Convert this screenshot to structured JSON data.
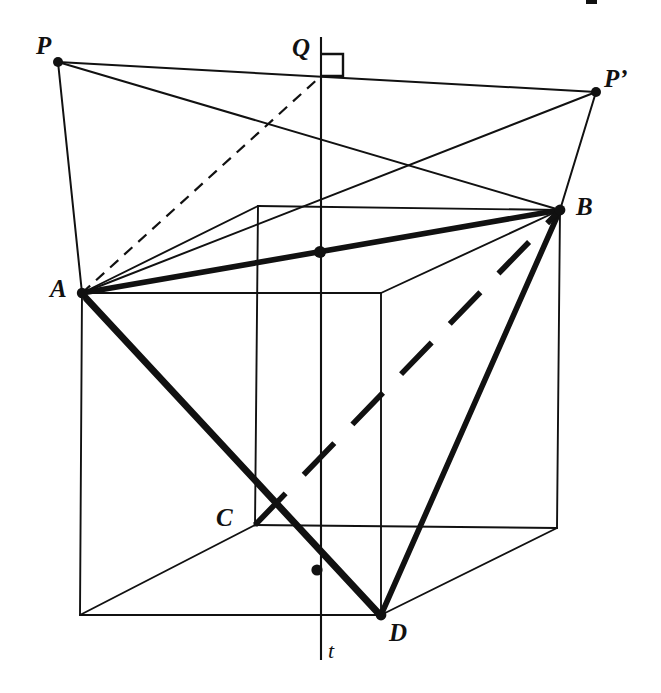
{
  "figure": {
    "background_color": "#ffffff",
    "stroke_color": "#111111",
    "width": 661,
    "height": 693
  },
  "labels": {
    "P": "P",
    "P_prime": "P’",
    "Q": "Q",
    "A": "A",
    "B": "B",
    "C": "C",
    "D": "D",
    "t": "t",
    "top_clipped": "▪"
  },
  "points": {
    "P": {
      "x": 58,
      "y": 62,
      "dot": true
    },
    "Q": {
      "x": 321,
      "y": 76,
      "dot": false
    },
    "P_prime": {
      "x": 596,
      "y": 92,
      "dot": true
    },
    "A": {
      "x": 82,
      "y": 293,
      "dot": true
    },
    "B": {
      "x": 560,
      "y": 210,
      "dot": true
    },
    "C": {
      "x": 255,
      "y": 525,
      "dot": false
    },
    "D": {
      "x": 381,
      "y": 615,
      "dot": true
    },
    "M_AB": {
      "x": 320,
      "y": 252,
      "dot": true
    },
    "M_CD": {
      "x": 317,
      "y": 570,
      "dot": true
    },
    "cube_front_top_left": {
      "x": 82,
      "y": 293,
      "dot": false
    },
    "cube_front_top_right": {
      "x": 381,
      "y": 293,
      "dot": false
    },
    "cube_front_bottom_left": {
      "x": 80,
      "y": 615,
      "dot": false
    },
    "cube_front_bottom_right": {
      "x": 381,
      "y": 615,
      "dot": false
    },
    "cube_back_top_left": {
      "x": 258,
      "y": 206,
      "dot": false
    },
    "cube_back_top_right": {
      "x": 560,
      "y": 210,
      "dot": false
    },
    "cube_back_bottom_left": {
      "x": 255,
      "y": 525,
      "dot": false
    },
    "cube_back_bottom_right": {
      "x": 557,
      "y": 528,
      "dot": false
    }
  },
  "segments": {
    "cube_edges": [
      {
        "name": "front-top",
        "from": "cube_front_top_left",
        "to": "cube_front_top_right"
      },
      {
        "name": "front-left",
        "from": "cube_front_top_left",
        "to": "cube_front_bottom_left"
      },
      {
        "name": "front-right",
        "from": "cube_front_top_right",
        "to": "cube_front_bottom_right"
      },
      {
        "name": "front-bottom",
        "from": "cube_front_bottom_left",
        "to": "cube_front_bottom_right"
      },
      {
        "name": "back-top",
        "from": "cube_back_top_left",
        "to": "cube_back_top_right"
      },
      {
        "name": "back-left",
        "from": "cube_back_top_left",
        "to": "cube_back_bottom_left"
      },
      {
        "name": "back-right",
        "from": "cube_back_top_right",
        "to": "cube_back_bottom_right"
      },
      {
        "name": "back-bottom",
        "from": "cube_back_bottom_left",
        "to": "cube_back_bottom_right"
      },
      {
        "name": "depth-top-left",
        "from": "cube_front_top_left",
        "to": "cube_back_top_left"
      },
      {
        "name": "depth-top-right",
        "from": "cube_front_top_right",
        "to": "cube_back_top_right"
      },
      {
        "name": "depth-bottom-left",
        "from": "cube_front_bottom_left",
        "to": "cube_back_bottom_left"
      },
      {
        "name": "depth-bottom-right",
        "from": "cube_front_bottom_right",
        "to": "cube_back_bottom_right"
      }
    ],
    "thick_solid": [
      {
        "name": "segment-AB",
        "from": "A",
        "to": "B"
      },
      {
        "name": "segment-AD",
        "from": "A",
        "to": "D"
      },
      {
        "name": "segment-AC-extended-D",
        "from": "A",
        "to": "D"
      },
      {
        "name": "segment-BD",
        "from": "B",
        "to": "D"
      }
    ],
    "thick_dashed": [
      {
        "name": "segment-CB-hidden",
        "from": "C",
        "to": "B"
      }
    ],
    "thin_dashed": [
      {
        "name": "segment-AQ",
        "from": "A",
        "to": "Q"
      }
    ],
    "thin_solid": [
      {
        "name": "segment-P-Pprime",
        "from": "P",
        "to": "P_prime"
      },
      {
        "name": "segment-PA",
        "from": "P",
        "to": "A"
      },
      {
        "name": "segment-PB",
        "from": "P",
        "to": "B"
      },
      {
        "name": "segment-Pprime-A",
        "from": "P_prime",
        "to": "A"
      },
      {
        "name": "segment-Pprime-B",
        "from": "P_prime",
        "to": "B"
      }
    ]
  },
  "axis_t": {
    "label": "t",
    "x": 321,
    "y_top": 37,
    "y_bottom": 660,
    "label_x": 330,
    "label_y": 646
  },
  "right_angle_mark": {
    "at": "Q",
    "x": 321,
    "y": 76,
    "size": 22,
    "direction": "up-right"
  },
  "midpoint_dots": [
    {
      "name": "midpoint-AB-on-t",
      "x": 320,
      "y": 252
    },
    {
      "name": "midpoint-CD-on-t",
      "x": 317,
      "y": 570
    }
  ],
  "label_positions": {
    "P": {
      "x": 36,
      "y": 33
    },
    "Q": {
      "x": 292,
      "y": 35
    },
    "P_prime": {
      "x": 604,
      "y": 66
    },
    "A": {
      "x": 50,
      "y": 276
    },
    "B": {
      "x": 576,
      "y": 194
    },
    "C": {
      "x": 216,
      "y": 505
    },
    "D": {
      "x": 389,
      "y": 620
    },
    "t": {
      "x": 328,
      "y": 640
    }
  }
}
